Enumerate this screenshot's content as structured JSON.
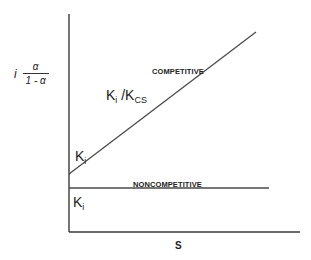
{
  "diagram": {
    "y_axis_label": {
      "prefix": "i",
      "numerator": "α",
      "denominator": "1 - α"
    },
    "x_axis_label": "S",
    "lines": {
      "competitive": {
        "label": "COMPETITIVE",
        "slope_label_main": "K",
        "slope_label_main_sub": "i",
        "slope_label_sep": " /K",
        "slope_label_den_sub": "CS",
        "intercept_label_main": "K",
        "intercept_label_sub": "i"
      },
      "noncompetitive": {
        "label": "NONCOMPETITIVE",
        "intercept_label_main": "K",
        "intercept_label_sub": "i"
      }
    },
    "colors": {
      "line": "#4a4a4a",
      "axis": "#3a3a3a",
      "text": "#222222",
      "background": "#ffffff"
    }
  }
}
